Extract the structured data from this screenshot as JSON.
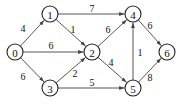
{
  "diagram": {
    "type": "weighted-directed-graph",
    "nodes": [
      {
        "id": "0",
        "label": "0",
        "x": 15,
        "y": 52
      },
      {
        "id": "1",
        "label": "1",
        "x": 50,
        "y": 14
      },
      {
        "id": "2",
        "label": "2",
        "x": 92,
        "y": 52
      },
      {
        "id": "3",
        "label": "3",
        "x": 50,
        "y": 88
      },
      {
        "id": "4",
        "label": "4",
        "x": 133,
        "y": 14
      },
      {
        "id": "5",
        "label": "5",
        "x": 133,
        "y": 88
      },
      {
        "id": "6",
        "label": "6",
        "x": 167,
        "y": 52
      }
    ],
    "edges": [
      {
        "from": "0",
        "to": "1",
        "weight": "4",
        "lx": 23,
        "ly": 28
      },
      {
        "from": "0",
        "to": "2",
        "weight": "6",
        "lx": 51,
        "ly": 45
      },
      {
        "from": "0",
        "to": "3",
        "weight": "6",
        "lx": 23,
        "ly": 76
      },
      {
        "from": "1",
        "to": "4",
        "weight": "7",
        "lx": 92,
        "ly": 8
      },
      {
        "from": "1",
        "to": "2",
        "weight": "1",
        "lx": 73,
        "ly": 29
      },
      {
        "from": "3",
        "to": "2",
        "weight": "2",
        "lx": 75,
        "ly": 73
      },
      {
        "from": "3",
        "to": "5",
        "weight": "5",
        "lx": 92,
        "ly": 82
      },
      {
        "from": "2",
        "to": "4",
        "weight": "6",
        "lx": 108,
        "ly": 29
      },
      {
        "from": "2",
        "to": "5",
        "weight": "4",
        "lx": 111,
        "ly": 62
      },
      {
        "from": "5",
        "to": "4",
        "weight": "1",
        "lx": 140,
        "ly": 52
      },
      {
        "from": "4",
        "to": "6",
        "weight": "6",
        "lx": 150,
        "ly": 25
      },
      {
        "from": "5",
        "to": "6",
        "weight": "8",
        "lx": 150,
        "ly": 77
      }
    ]
  }
}
